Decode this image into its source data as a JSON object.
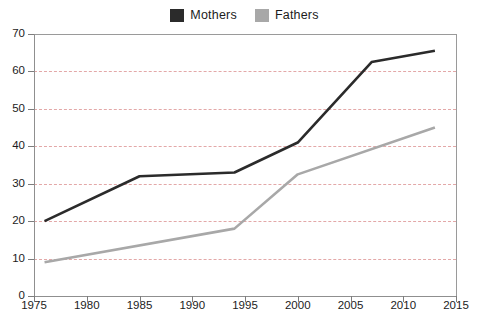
{
  "chart_data": {
    "type": "line",
    "title": "",
    "xlabel": "",
    "ylabel": "",
    "xlim": [
      1975,
      2015
    ],
    "ylim": [
      0,
      70
    ],
    "grid": true,
    "grid_style": "dashed horizontal",
    "legend_position": "top-center",
    "x_ticks": [
      "1975",
      "1980",
      "1985",
      "1990",
      "1995",
      "2000",
      "2005",
      "2010",
      "2015"
    ],
    "x_tick_values": [
      1975,
      1980,
      1985,
      1990,
      1995,
      2000,
      2005,
      2010,
      2015
    ],
    "y_ticks": [
      "0",
      "10",
      "20",
      "30",
      "40",
      "50",
      "60",
      "70"
    ],
    "y_tick_values": [
      0,
      10,
      20,
      30,
      40,
      50,
      60,
      70
    ],
    "series": [
      {
        "name": "Mothers",
        "color": "#2b2b2b",
        "x": [
          1976,
          1985,
          1994,
          2000,
          2007,
          2013
        ],
        "values": [
          20,
          32,
          33,
          41,
          62.5,
          65.5
        ]
      },
      {
        "name": "Fathers",
        "color": "#a8a8a8",
        "x": [
          1976,
          1994,
          2000,
          2013
        ],
        "values": [
          9,
          18,
          32.5,
          45
        ]
      }
    ]
  },
  "legend": {
    "items": [
      {
        "label": "Mothers",
        "color": "#2b2b2b",
        "swatch": "legend-swatch-mothers"
      },
      {
        "label": "Fathers",
        "color": "#a8a8a8",
        "swatch": "legend-swatch-fathers"
      }
    ]
  },
  "axes": {
    "gridline_color": "#e3a8a8",
    "axis_color": "#8f8f8f"
  }
}
